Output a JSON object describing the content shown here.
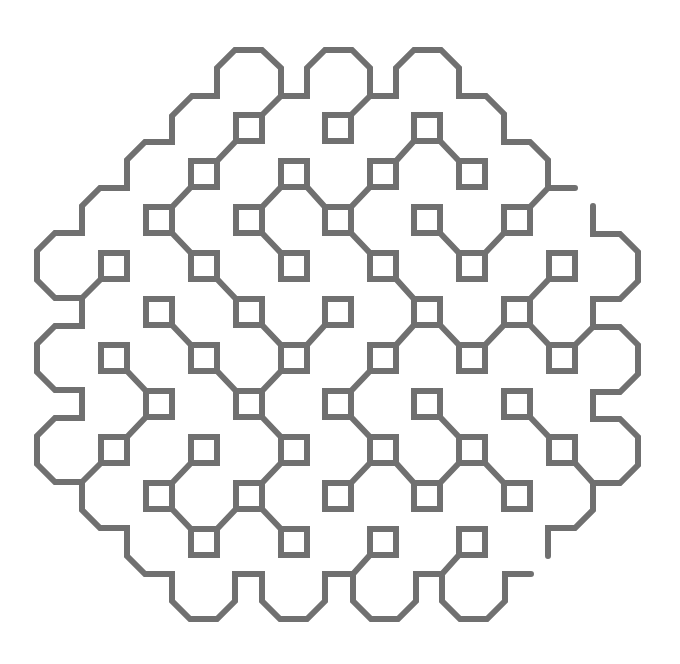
{
  "figure": {
    "type": "line-art fractal curve (square-lattice tiling)",
    "background": "#ffffff",
    "stroke_color": "#707070",
    "stroke_width": 6,
    "lattice": {
      "x_centers": [
        114,
        159,
        204,
        249,
        294,
        338,
        383,
        427,
        472,
        517,
        562
      ],
      "y_origin": 128,
      "y_step": 46,
      "square_half_size": 13
    },
    "squares": [
      [
        0,
        3
      ],
      [
        0,
        5
      ],
      [
        0,
        7
      ],
      [
        1,
        2
      ],
      [
        1,
        4
      ],
      [
        1,
        6
      ],
      [
        1,
        8
      ],
      [
        2,
        1
      ],
      [
        2,
        3
      ],
      [
        2,
        5
      ],
      [
        2,
        7
      ],
      [
        2,
        9
      ],
      [
        3,
        0
      ],
      [
        3,
        2
      ],
      [
        3,
        4
      ],
      [
        3,
        6
      ],
      [
        3,
        8
      ],
      [
        3,
        10
      ],
      [
        4,
        1
      ],
      [
        4,
        3
      ],
      [
        4,
        5
      ],
      [
        4,
        7
      ],
      [
        4,
        9
      ],
      [
        5,
        0
      ],
      [
        5,
        2
      ],
      [
        5,
        4
      ],
      [
        5,
        6
      ],
      [
        5,
        8
      ],
      [
        5,
        10
      ],
      [
        6,
        1
      ],
      [
        6,
        3
      ],
      [
        6,
        5
      ],
      [
        6,
        7
      ],
      [
        6,
        9
      ],
      [
        7,
        0
      ],
      [
        7,
        2
      ],
      [
        7,
        4
      ],
      [
        7,
        6
      ],
      [
        7,
        8
      ],
      [
        7,
        10
      ],
      [
        8,
        1
      ],
      [
        8,
        3
      ],
      [
        8,
        5
      ],
      [
        8,
        7
      ],
      [
        8,
        9
      ],
      [
        9,
        2
      ],
      [
        9,
        4
      ],
      [
        9,
        6
      ],
      [
        9,
        8
      ]
    ],
    "square_links": [
      [
        [
          0,
          3
        ],
        [
          1,
          2
        ]
      ],
      [
        [
          0,
          7
        ],
        [
          1,
          6
        ]
      ],
      [
        [
          0,
          7
        ],
        [
          1,
          8
        ]
      ],
      [
        [
          1,
          2
        ],
        [
          2,
          1
        ]
      ],
      [
        [
          1,
          4
        ],
        [
          2,
          3
        ]
      ],
      [
        [
          1,
          4
        ],
        [
          2,
          5
        ]
      ],
      [
        [
          1,
          6
        ],
        [
          2,
          5
        ]
      ],
      [
        [
          2,
          1
        ],
        [
          3,
          2
        ]
      ],
      [
        [
          2,
          3
        ],
        [
          3,
          4
        ]
      ],
      [
        [
          2,
          5
        ],
        [
          3,
          6
        ]
      ],
      [
        [
          2,
          7
        ],
        [
          3,
          8
        ]
      ],
      [
        [
          2,
          9
        ],
        [
          3,
          8
        ]
      ],
      [
        [
          3,
          2
        ],
        [
          4,
          3
        ]
      ],
      [
        [
          3,
          6
        ],
        [
          4,
          7
        ]
      ],
      [
        [
          3,
          10
        ],
        [
          4,
          9
        ]
      ],
      [
        [
          4,
          1
        ],
        [
          5,
          2
        ]
      ],
      [
        [
          4,
          3
        ],
        [
          5,
          4
        ]
      ],
      [
        [
          4,
          5
        ],
        [
          5,
          4
        ]
      ],
      [
        [
          4,
          7
        ],
        [
          5,
          6
        ]
      ],
      [
        [
          4,
          7
        ],
        [
          5,
          8
        ]
      ],
      [
        [
          4,
          9
        ],
        [
          5,
          8
        ]
      ],
      [
        [
          4,
          9
        ],
        [
          5,
          10
        ]
      ],
      [
        [
          5,
          0
        ],
        [
          6,
          1
        ]
      ],
      [
        [
          5,
          2
        ],
        [
          6,
          3
        ]
      ],
      [
        [
          5,
          4
        ],
        [
          6,
          3
        ]
      ],
      [
        [
          5,
          6
        ],
        [
          6,
          5
        ]
      ],
      [
        [
          6,
          1
        ],
        [
          7,
          0
        ]
      ],
      [
        [
          6,
          3
        ],
        [
          7,
          4
        ]
      ],
      [
        [
          6,
          5
        ],
        [
          7,
          6
        ]
      ],
      [
        [
          6,
          7
        ],
        [
          7,
          8
        ]
      ],
      [
        [
          6,
          9
        ],
        [
          7,
          10
        ]
      ],
      [
        [
          7,
          2
        ],
        [
          8,
          1
        ]
      ],
      [
        [
          7,
          4
        ],
        [
          8,
          3
        ]
      ],
      [
        [
          7,
          6
        ],
        [
          8,
          5
        ]
      ],
      [
        [
          7,
          6
        ],
        [
          8,
          7
        ]
      ],
      [
        [
          7,
          8
        ],
        [
          8,
          7
        ]
      ],
      [
        [
          7,
          8
        ],
        [
          8,
          9
        ]
      ],
      [
        [
          8,
          1
        ],
        [
          9,
          2
        ]
      ],
      [
        [
          8,
          3
        ],
        [
          9,
          2
        ]
      ],
      [
        [
          8,
          3
        ],
        [
          9,
          4
        ]
      ]
    ],
    "outer_links": [
      {
        "square": [
          0,
          3
        ],
        "corner": "TR",
        "to": [
          281,
          96
        ]
      },
      {
        "square": [
          0,
          5
        ],
        "corner": "TR",
        "to": [
          370,
          96
        ]
      },
      {
        "square": [
          2,
          9
        ],
        "corner": "TR",
        "to": [
          548,
          188
        ]
      },
      {
        "square": [
          3,
          0
        ],
        "corner": "BL",
        "to": [
          82,
          298
        ]
      },
      {
        "square": [
          5,
          10
        ],
        "corner": "TR",
        "to": [
          593,
          327
        ]
      },
      {
        "square": [
          7,
          0
        ],
        "corner": "BL",
        "to": [
          82,
          482
        ]
      },
      {
        "square": [
          7,
          10
        ],
        "corner": "BR",
        "to": [
          593,
          483
        ]
      },
      {
        "square": [
          9,
          6
        ],
        "corner": "BL",
        "to": [
          353,
          574
        ]
      },
      {
        "square": [
          9,
          8
        ],
        "corner": "BL",
        "to": [
          442,
          574
        ]
      }
    ],
    "outer_paths": [
      [
        [
          575,
          188
        ],
        [
          548,
          188
        ],
        [
          548,
          160
        ],
        [
          530,
          142
        ],
        [
          504,
          142
        ],
        [
          504,
          114
        ],
        [
          486,
          96
        ],
        [
          459,
          96
        ],
        [
          459,
          68
        ],
        [
          441,
          50
        ],
        [
          414,
          50
        ],
        [
          396,
          68
        ],
        [
          396,
          96
        ],
        [
          370,
          96
        ],
        [
          370,
          68
        ],
        [
          352,
          50
        ],
        [
          325,
          50
        ],
        [
          307,
          68
        ],
        [
          307,
          96
        ],
        [
          281,
          96
        ],
        [
          281,
          68
        ],
        [
          262,
          50
        ],
        [
          235,
          50
        ],
        [
          217,
          68
        ],
        [
          217,
          96
        ],
        [
          192,
          96
        ],
        [
          172,
          116
        ],
        [
          172,
          142
        ],
        [
          145,
          142
        ],
        [
          127,
          160
        ],
        [
          127,
          188
        ],
        [
          100,
          188
        ],
        [
          82,
          206
        ],
        [
          82,
          233
        ],
        [
          55,
          233
        ],
        [
          37,
          251
        ],
        [
          37,
          280
        ],
        [
          55,
          298
        ],
        [
          82,
          298
        ],
        [
          82,
          326
        ],
        [
          55,
          326
        ],
        [
          37,
          344
        ],
        [
          37,
          372
        ],
        [
          55,
          390
        ],
        [
          82,
          390
        ],
        [
          82,
          418
        ],
        [
          55,
          418
        ],
        [
          37,
          436
        ],
        [
          37,
          464
        ],
        [
          55,
          482
        ],
        [
          82,
          482
        ],
        [
          82,
          510
        ],
        [
          100,
          528
        ],
        [
          127,
          528
        ],
        [
          127,
          556
        ],
        [
          145,
          574
        ],
        [
          172,
          574
        ],
        [
          172,
          601
        ],
        [
          190,
          619
        ],
        [
          217,
          619
        ],
        [
          235,
          601
        ],
        [
          235,
          574
        ],
        [
          262,
          574
        ],
        [
          262,
          601
        ],
        [
          280,
          619
        ],
        [
          307,
          619
        ],
        [
          325,
          601
        ],
        [
          325,
          574
        ],
        [
          353,
          574
        ],
        [
          353,
          601
        ],
        [
          371,
          619
        ],
        [
          398,
          619
        ],
        [
          416,
          601
        ],
        [
          416,
          574
        ],
        [
          442,
          574
        ],
        [
          442,
          601
        ],
        [
          460,
          619
        ],
        [
          487,
          619
        ],
        [
          505,
          601
        ],
        [
          505,
          574
        ],
        [
          531,
          574
        ]
      ],
      [
        [
          548,
          556
        ],
        [
          548,
          528
        ],
        [
          575,
          528
        ],
        [
          593,
          510
        ],
        [
          593,
          483
        ],
        [
          620,
          483
        ],
        [
          638,
          465
        ],
        [
          638,
          437
        ],
        [
          620,
          419
        ],
        [
          593,
          419
        ],
        [
          593,
          392
        ],
        [
          620,
          392
        ],
        [
          638,
          374
        ],
        [
          638,
          345
        ],
        [
          620,
          327
        ],
        [
          593,
          327
        ],
        [
          593,
          299
        ],
        [
          620,
          299
        ],
        [
          638,
          281
        ],
        [
          638,
          252
        ],
        [
          620,
          234
        ],
        [
          593,
          234
        ],
        [
          593,
          206
        ]
      ]
    ]
  }
}
